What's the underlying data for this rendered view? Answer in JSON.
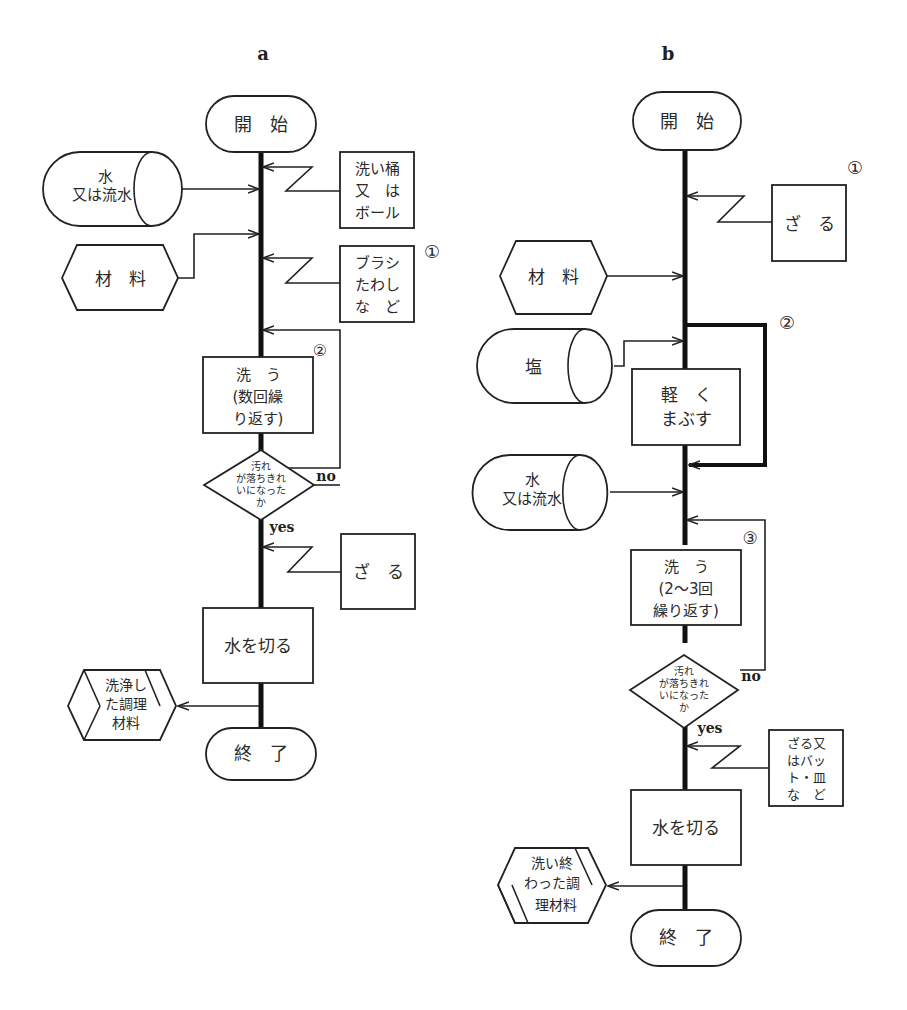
{
  "header": {
    "cut_off_text": ""
  },
  "panel_a": {
    "label": "a",
    "start": "開　始",
    "water": [
      "水",
      "又は流水"
    ],
    "tub": [
      "洗い桶",
      "又　は",
      "ボール"
    ],
    "material": "材　料",
    "brush": [
      "ブラシ",
      "たわし",
      "な　ど"
    ],
    "note1": "①",
    "note2": "②",
    "wash": [
      "洗　う",
      "(数回繰",
      "り返す)"
    ],
    "decision": [
      "汚れ",
      "が落ちきれ",
      "いになった",
      "か"
    ],
    "no": "no",
    "yes": "yes",
    "colander": "ざ　る",
    "drain": "水を切る",
    "output": [
      "洗浄し",
      "た調理",
      "材料"
    ],
    "end": "終　了"
  },
  "panel_b": {
    "label": "b",
    "start": "開　始",
    "colander": "ざ　る",
    "note1": "①",
    "material": "材　料",
    "note2": "②",
    "salt": "塩",
    "rub": [
      "軽　く",
      "まぶす"
    ],
    "water": [
      "水",
      "又は流水"
    ],
    "note3": "③",
    "wash": [
      "洗　う",
      "(2～3回",
      "繰り返す)"
    ],
    "decision": [
      "汚れ",
      "が落ちきれ",
      "いになった",
      "か"
    ],
    "no": "no",
    "yes": "yes",
    "tools": [
      "ざる又",
      "はバッ",
      "ト・皿",
      "な　ど"
    ],
    "drain": "水を切る",
    "output": [
      "洗い終",
      "わった調",
      "理材料"
    ],
    "end": "終　了"
  }
}
